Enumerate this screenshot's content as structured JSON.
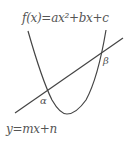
{
  "diagram": {
    "type": "function-graph",
    "curves": [
      {
        "id": "parabola",
        "equation": "f(x)=ax²+bx+c",
        "label": "f(x)=ax²+bx+c",
        "color": "#444444"
      },
      {
        "id": "line",
        "equation": "y=mx+n",
        "label": "y=mx+n",
        "color": "#444444"
      }
    ],
    "intersections": [
      {
        "id": "alpha",
        "label": "α"
      },
      {
        "id": "beta",
        "label": "β"
      }
    ]
  }
}
